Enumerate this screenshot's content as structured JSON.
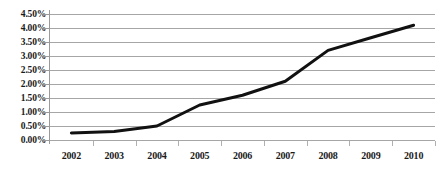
{
  "chart_data": {
    "type": "line",
    "title": "",
    "subtitle": "",
    "xlabel": "",
    "ylabel": "",
    "categories": [
      "2002",
      "2003",
      "2004",
      "2005",
      "2006",
      "2007",
      "2008",
      "2009",
      "2010"
    ],
    "values": [
      0.25,
      0.3,
      0.5,
      1.25,
      1.6,
      2.1,
      3.2,
      3.65,
      4.1
    ],
    "value_labels": [
      "0.25%",
      "0.30%",
      "0.50%",
      "1.25%",
      "1.60%",
      "2.10%",
      "3.20%",
      "3.65%",
      "4.10%"
    ],
    "series": [
      {
        "name": "",
        "values": [
          0.25,
          0.3,
          0.5,
          1.25,
          1.6,
          2.1,
          3.2,
          3.65,
          4.1
        ]
      }
    ],
    "ylim": [
      0.0,
      4.5
    ],
    "ytick_values": [
      0.0,
      0.5,
      1.0,
      1.5,
      2.0,
      2.5,
      3.0,
      3.5,
      4.0,
      4.5
    ],
    "ytick_labels": [
      "0.00%",
      "0.50%",
      "1.00%",
      "1.50%",
      "2.00%",
      "2.50%",
      "3.00%",
      "3.50%",
      "4.00%",
      "4.50%"
    ],
    "grid": true,
    "grid_axis": "y",
    "legend": false,
    "legend_position": "none",
    "line_color": "#111111",
    "grid_color": "#a6a6a6",
    "axis_color": "#9a9a9a",
    "background_color": "#ffffff",
    "markers": false,
    "line_width": 3
  }
}
